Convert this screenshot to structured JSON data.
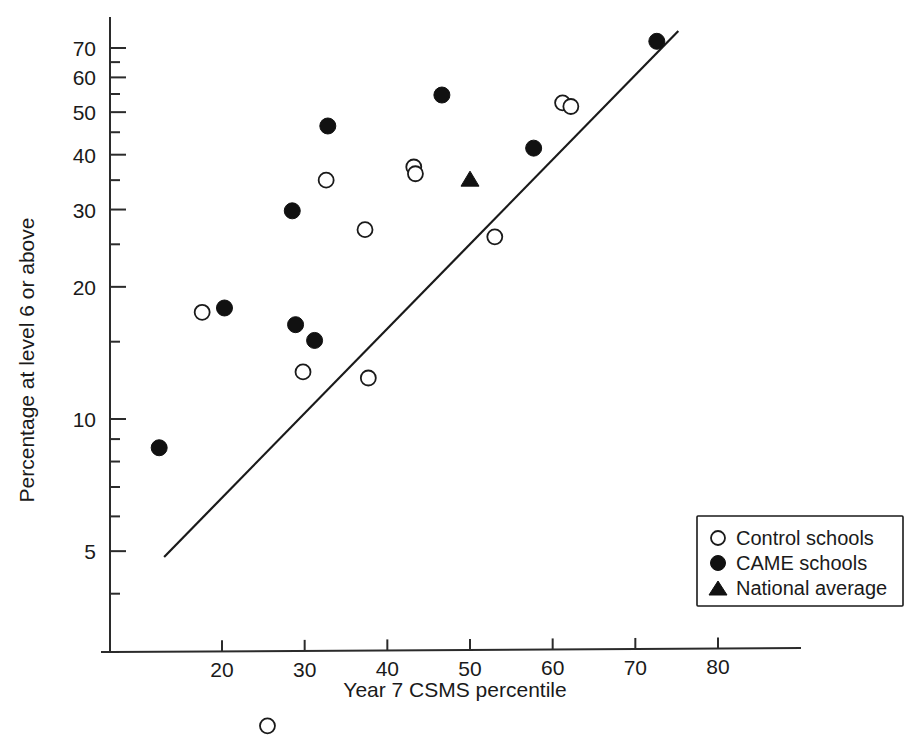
{
  "chart_data": {
    "type": "scatter",
    "title": "",
    "xlabel": "Year 7 CSMS percentile",
    "ylabel": "Percentage at level 6 or above",
    "yscale": "log",
    "xlim": [
      11,
      84
    ],
    "ylim": [
      1.5,
      80
    ],
    "grid": false,
    "xticks": [
      20,
      30,
      40,
      50,
      60,
      70,
      80
    ],
    "xtick_labels": [
      "20",
      "30",
      "40",
      "50",
      "60",
      "70",
      "80"
    ],
    "yticks": [
      5,
      10,
      20,
      30,
      40,
      50,
      60,
      70
    ],
    "ytick_labels": [
      "5",
      "10",
      "20",
      "30",
      "40",
      "50",
      "60",
      "70"
    ],
    "legend_position": "lower right",
    "series": [
      {
        "name": "Control schools",
        "marker": "open-circle",
        "color": "#1a1a1a",
        "points": [
          {
            "x": 17.6,
            "y": 17.5
          },
          {
            "x": 25.5,
            "y": 2.0
          },
          {
            "x": 29.8,
            "y": 12.8
          },
          {
            "x": 32.6,
            "y": 35.0
          },
          {
            "x": 37.3,
            "y": 27.0
          },
          {
            "x": 37.7,
            "y": 12.4
          },
          {
            "x": 43.2,
            "y": 37.5
          },
          {
            "x": 43.4,
            "y": 36.2
          },
          {
            "x": 53.0,
            "y": 26.0
          },
          {
            "x": 61.2,
            "y": 52.5
          },
          {
            "x": 62.2,
            "y": 51.5
          }
        ]
      },
      {
        "name": "CAME schools",
        "marker": "filled-circle",
        "color": "#111111",
        "points": [
          {
            "x": 12.4,
            "y": 8.6
          },
          {
            "x": 20.3,
            "y": 17.9
          },
          {
            "x": 28.5,
            "y": 29.8
          },
          {
            "x": 28.9,
            "y": 16.4
          },
          {
            "x": 31.2,
            "y": 15.1
          },
          {
            "x": 32.8,
            "y": 46.5
          },
          {
            "x": 46.6,
            "y": 54.7
          },
          {
            "x": 57.7,
            "y": 41.4
          },
          {
            "x": 72.6,
            "y": 72.5
          }
        ]
      },
      {
        "name": "National average",
        "marker": "filled-triangle",
        "color": "#111111",
        "points": [
          {
            "x": 50.0,
            "y": 35.0
          }
        ]
      }
    ],
    "trendline": {
      "label": "regression line",
      "x_start": 13.0,
      "y_start": 4.85,
      "x_end": 75.2,
      "y_end": 76.5
    },
    "legend": [
      {
        "label": "Control schools",
        "marker": "open-circle"
      },
      {
        "label": "CAME schools",
        "marker": "filled-circle"
      },
      {
        "label": "National average",
        "marker": "filled-triangle"
      }
    ]
  }
}
